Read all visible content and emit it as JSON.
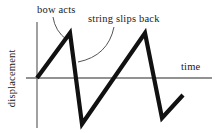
{
  "figure": {
    "background_color": "#ffffff",
    "axis_color": "#6e6e6e",
    "curve_color": "#111111",
    "leader_color": "#555555",
    "text_color": "#1a1a1a",
    "annotations": {
      "bow_acts": "bow acts",
      "string_slips_back": "string slips back"
    },
    "axes": {
      "x_label": "time",
      "y_label": "displacement"
    }
  },
  "chart_data": {
    "type": "line",
    "title": "",
    "subtitle": "",
    "xlabel": "time",
    "ylabel": "displacement",
    "grid": false,
    "legend": false,
    "axis_origin_px": [
      37,
      78
    ],
    "xlim": [
      0,
      216
    ],
    "ylim": [
      -1.15,
      1.0
    ],
    "annotations": [
      {
        "text": "bow acts",
        "text_anchor_px": [
          37,
          5
        ],
        "leader_from_px": [
          53,
          17
        ],
        "leader_to_px": [
          67,
          40
        ],
        "leader_control_px": [
          55,
          31
        ],
        "describes": "rising ramp where bow drags the string"
      },
      {
        "text": "string slips back",
        "text_anchor_px": [
          88,
          14
        ],
        "leader_from_px": [
          114,
          27
        ],
        "leader_to_px": [
          78,
          62
        ],
        "leader_control_px": [
          108,
          56
        ],
        "describes": "steep falling edge where string slips back"
      }
    ],
    "series": [
      {
        "name": "displacement",
        "points_px": [
          [
            37,
            78
          ],
          [
            70,
            33
          ],
          [
            82,
            124
          ],
          [
            145,
            33
          ],
          [
            162,
            118
          ],
          [
            183,
            95
          ]
        ],
        "x": [
          0,
          33,
          45,
          108,
          125,
          146
        ],
        "values": [
          0.0,
          1.0,
          -1.04,
          1.0,
          -0.9,
          -0.38
        ]
      }
    ]
  }
}
